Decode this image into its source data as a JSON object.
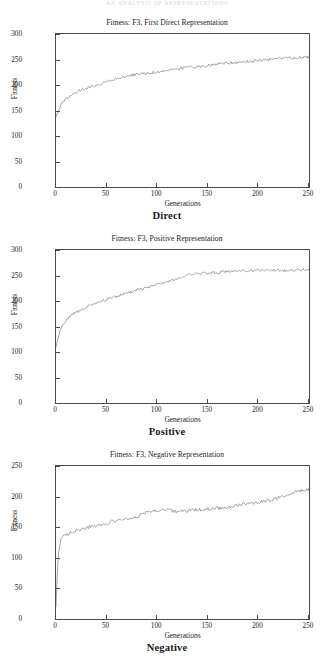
{
  "running_head": "AN ANALYSIS OF REPRESENTATIONS",
  "figures": [
    {
      "caption": "Direct",
      "chart_data": {
        "type": "line",
        "title": "Fitness: F3, First Direct Representation",
        "xlabel": "Generations",
        "ylabel": "Fitness",
        "xlim": [
          0,
          250
        ],
        "ylim": [
          0,
          300
        ],
        "xticks": [
          0,
          50,
          100,
          150,
          200,
          250
        ],
        "yticks": [
          0,
          50,
          100,
          150,
          200,
          250,
          300
        ],
        "grid": false,
        "legend": "none",
        "line_color": "#9a9a9a",
        "x": [
          0,
          1,
          2,
          3,
          4,
          5,
          7,
          10,
          13,
          16,
          20,
          25,
          30,
          35,
          40,
          45,
          50,
          55,
          60,
          65,
          70,
          75,
          80,
          85,
          90,
          95,
          100,
          105,
          110,
          115,
          120,
          125,
          130,
          135,
          140,
          145,
          150,
          155,
          160,
          165,
          170,
          175,
          180,
          185,
          190,
          195,
          200,
          205,
          210,
          215,
          220,
          225,
          230,
          235,
          240,
          245,
          250
        ],
        "values": [
          138,
          142,
          147,
          152,
          157,
          161,
          167,
          173,
          178,
          182,
          186,
          190,
          194,
          197,
          200,
          203,
          206,
          209,
          212,
          215,
          217,
          219,
          221,
          222,
          223,
          224,
          226,
          227,
          229,
          230,
          232,
          233,
          234,
          235,
          236,
          237,
          238,
          240,
          241,
          242,
          243,
          244,
          244,
          245,
          246,
          247,
          248,
          249,
          250,
          251,
          252,
          252,
          253,
          253,
          254,
          254,
          255
        ]
      }
    },
    {
      "caption": "Positive",
      "chart_data": {
        "type": "line",
        "title": "Fitness: F3, Positive Representation",
        "xlabel": "Generations",
        "ylabel": "Fitness",
        "xlim": [
          0,
          250
        ],
        "ylim": [
          0,
          300
        ],
        "xticks": [
          0,
          50,
          100,
          150,
          200,
          250
        ],
        "yticks": [
          0,
          50,
          100,
          150,
          200,
          250,
          300
        ],
        "grid": false,
        "legend": "none",
        "line_color": "#9a9a9a",
        "x": [
          0,
          1,
          2,
          3,
          4,
          5,
          7,
          10,
          13,
          16,
          20,
          25,
          30,
          35,
          40,
          45,
          50,
          55,
          60,
          65,
          70,
          75,
          80,
          85,
          90,
          95,
          100,
          105,
          110,
          115,
          120,
          125,
          130,
          135,
          140,
          145,
          150,
          155,
          160,
          165,
          170,
          175,
          180,
          185,
          190,
          195,
          200,
          205,
          210,
          215,
          220,
          225,
          230,
          235,
          240,
          245,
          250
        ],
        "values": [
          110,
          118,
          126,
          134,
          141,
          147,
          155,
          163,
          169,
          173,
          178,
          183,
          188,
          192,
          196,
          199,
          203,
          206,
          209,
          212,
          215,
          218,
          221,
          224,
          227,
          229,
          232,
          235,
          238,
          241,
          244,
          247,
          250,
          252,
          253,
          254,
          255,
          256,
          256,
          257,
          257,
          258,
          258,
          259,
          259,
          260,
          260,
          261,
          261,
          261,
          260,
          259,
          259,
          260,
          261,
          262,
          262
        ]
      }
    },
    {
      "caption": "Negative",
      "chart_data": {
        "type": "line",
        "title": "Fitness: F3, Negative Representation",
        "xlabel": "Generations",
        "ylabel": "Fitness",
        "xlim": [
          0,
          250
        ],
        "ylim": [
          0,
          250
        ],
        "xticks": [
          0,
          50,
          100,
          150,
          200,
          250
        ],
        "yticks": [
          0,
          50,
          100,
          150,
          200,
          250
        ],
        "grid": false,
        "legend": "none",
        "line_color": "#9a9a9a",
        "x": [
          0,
          1,
          2,
          3,
          4,
          5,
          7,
          10,
          13,
          16,
          20,
          25,
          30,
          35,
          40,
          45,
          50,
          55,
          60,
          65,
          70,
          75,
          80,
          85,
          90,
          95,
          100,
          105,
          110,
          115,
          120,
          125,
          130,
          135,
          140,
          145,
          150,
          155,
          160,
          165,
          170,
          175,
          180,
          185,
          190,
          195,
          200,
          205,
          210,
          215,
          220,
          225,
          230,
          235,
          240,
          245,
          250
        ],
        "values": [
          20,
          62,
          96,
          112,
          124,
          131,
          135,
          137,
          140,
          142,
          145,
          147,
          149,
          151,
          152,
          154,
          155,
          159,
          160,
          161,
          162,
          165,
          168,
          171,
          174,
          176,
          177,
          178,
          178,
          177,
          176,
          176,
          177,
          178,
          179,
          179,
          180,
          180,
          181,
          182,
          183,
          184,
          186,
          188,
          189,
          189,
          190,
          192,
          194,
          196,
          198,
          200,
          203,
          206,
          209,
          211,
          212
        ]
      }
    }
  ]
}
